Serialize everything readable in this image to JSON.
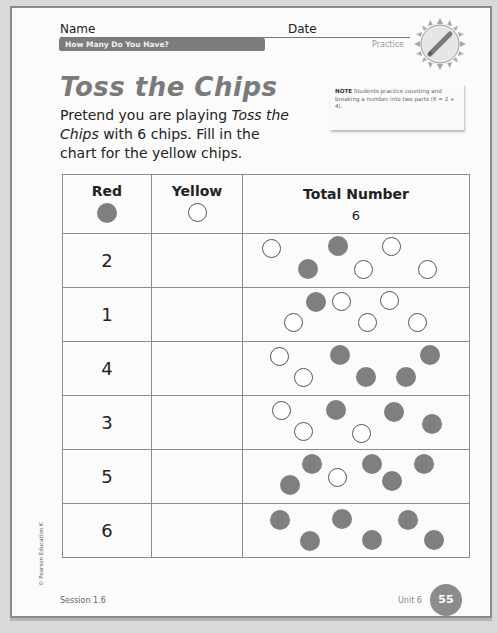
{
  "header": {
    "name_label": "Name",
    "date_label": "Date",
    "unit_title": "How Many Do You Have?",
    "type_label": "Practice",
    "badge_icon": "pencil-icon"
  },
  "title": "Toss the Chips",
  "instructions": {
    "part1": "Pretend you are playing ",
    "game_name": "Toss the Chips",
    "part2": " with 6 chips. Fill in the chart for the yellow chips."
  },
  "note": {
    "label": "NOTE",
    "text": " Students practice counting and breaking a number into two parts (6 = 2 + 4)."
  },
  "chart": {
    "headers": {
      "red": "Red",
      "yellow": "Yellow",
      "total": "Total Number",
      "total_value": "6"
    },
    "colors": {
      "red_chip": "#7f7f7f",
      "yellow_chip": "#ffffff"
    },
    "rows": [
      {
        "red": "2",
        "yellow": "",
        "chips": [
          {
            "x": 14,
            "y": 5,
            "f": false
          },
          {
            "x": 80,
            "y": 2,
            "f": true
          },
          {
            "x": 134,
            "y": 3,
            "f": false
          },
          {
            "x": 50,
            "y": 25,
            "f": true
          },
          {
            "x": 106,
            "y": 26,
            "f": false
          },
          {
            "x": 170,
            "y": 26,
            "f": false
          }
        ]
      },
      {
        "red": "1",
        "yellow": "",
        "chips": [
          {
            "x": 58,
            "y": 4,
            "f": true
          },
          {
            "x": 84,
            "y": 4,
            "f": false
          },
          {
            "x": 132,
            "y": 3,
            "f": false
          },
          {
            "x": 36,
            "y": 25,
            "f": false
          },
          {
            "x": 110,
            "y": 25,
            "f": false
          },
          {
            "x": 160,
            "y": 25,
            "f": false
          }
        ]
      },
      {
        "red": "4",
        "yellow": "",
        "chips": [
          {
            "x": 22,
            "y": 5,
            "f": false
          },
          {
            "x": 82,
            "y": 3,
            "f": true
          },
          {
            "x": 172,
            "y": 3,
            "f": true
          },
          {
            "x": 46,
            "y": 26,
            "f": false
          },
          {
            "x": 108,
            "y": 25,
            "f": true
          },
          {
            "x": 148,
            "y": 25,
            "f": true
          }
        ]
      },
      {
        "red": "3",
        "yellow": "",
        "chips": [
          {
            "x": 24,
            "y": 5,
            "f": false
          },
          {
            "x": 78,
            "y": 4,
            "f": true
          },
          {
            "x": 136,
            "y": 6,
            "f": true
          },
          {
            "x": 46,
            "y": 26,
            "f": false
          },
          {
            "x": 104,
            "y": 28,
            "f": false
          },
          {
            "x": 174,
            "y": 18,
            "f": true
          }
        ]
      },
      {
        "red": "5",
        "yellow": "",
        "chips": [
          {
            "x": 54,
            "y": 4,
            "f": true
          },
          {
            "x": 114,
            "y": 4,
            "f": true
          },
          {
            "x": 166,
            "y": 4,
            "f": true
          },
          {
            "x": 32,
            "y": 25,
            "f": true
          },
          {
            "x": 80,
            "y": 18,
            "f": false
          },
          {
            "x": 134,
            "y": 21,
            "f": true
          }
        ]
      },
      {
        "red": "6",
        "yellow": "",
        "chips": [
          {
            "x": 22,
            "y": 6,
            "f": true
          },
          {
            "x": 84,
            "y": 5,
            "f": true
          },
          {
            "x": 150,
            "y": 6,
            "f": true
          },
          {
            "x": 52,
            "y": 27,
            "f": true
          },
          {
            "x": 114,
            "y": 26,
            "f": true
          },
          {
            "x": 176,
            "y": 26,
            "f": true
          }
        ]
      }
    ]
  },
  "footer": {
    "copyright": "© Pearson Education K",
    "session": "Session 1.6",
    "unit": "Unit 6",
    "page_number": "55"
  }
}
